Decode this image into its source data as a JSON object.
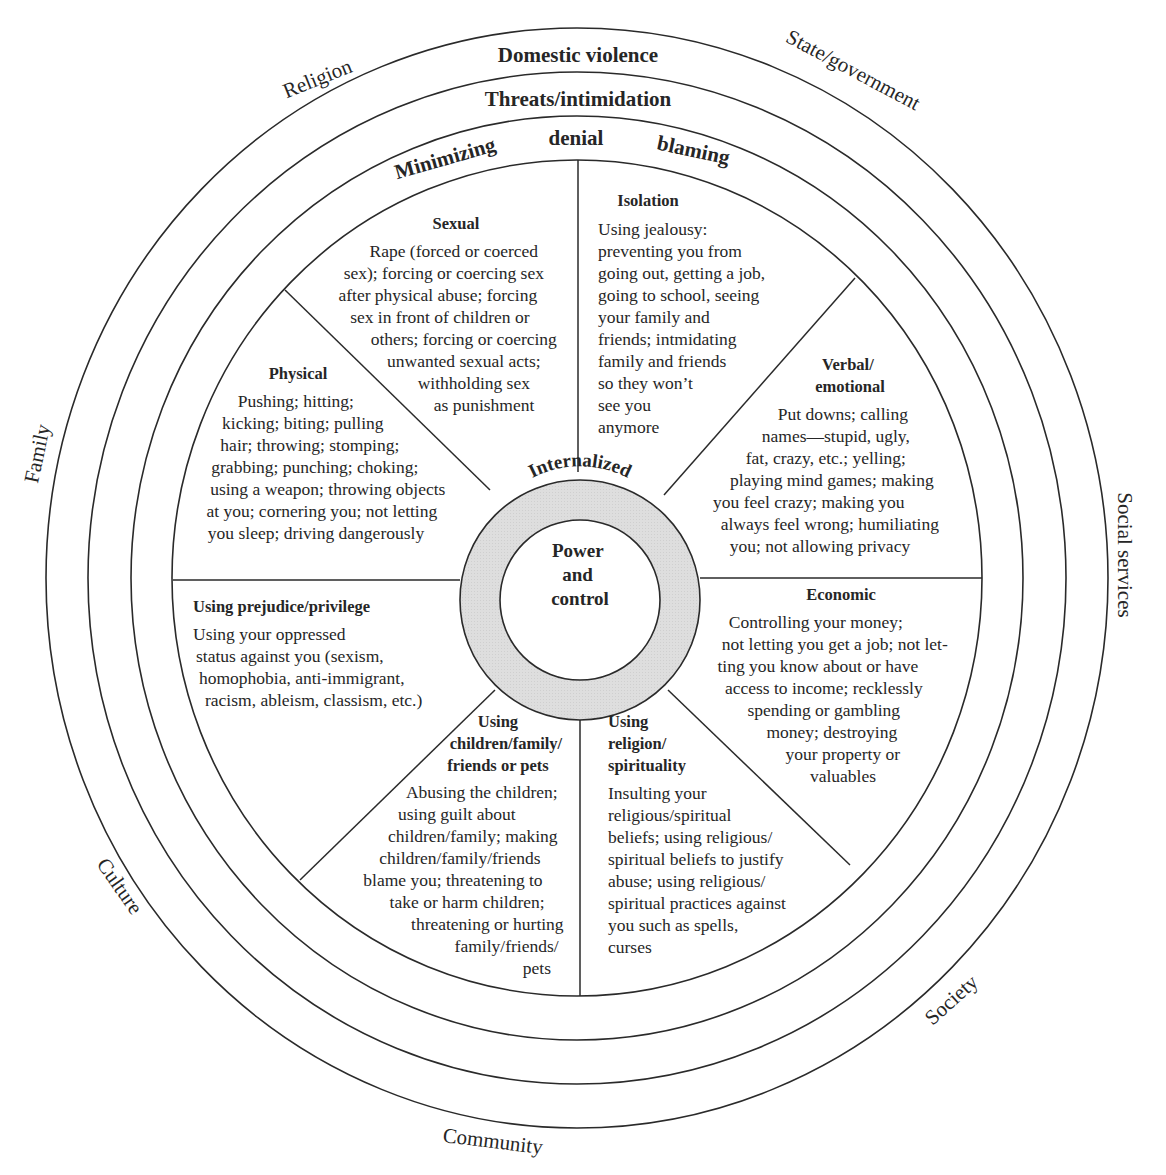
{
  "diagram": {
    "type": "concentric wheel",
    "center": {
      "title_lines": [
        "Power",
        "and",
        "control"
      ],
      "ring_label": "Internalized"
    },
    "outer_context_labels": {
      "religion": "Religion",
      "state_government": "State/government",
      "family": "Family",
      "social_services": "Social services",
      "culture": "Culture",
      "society": "Society",
      "community": "Community"
    },
    "rings": {
      "domestic_violence": "Domestic violence",
      "threats": "Threats/intimidation",
      "minimizing": "Minimizing",
      "denial": "denial",
      "blaming": "blaming"
    },
    "segments": {
      "sexual": {
        "title": "Sexual",
        "lines": [
          "Rape (forced or coerced",
          "sex); forcing or coercing sex",
          "after physical abuse; forcing",
          "sex in front of children or",
          "others; forcing or coercing",
          "unwanted sexual acts;",
          "withholding sex",
          "as punishment"
        ]
      },
      "isolation": {
        "title": "Isolation",
        "lines": [
          "Using jealousy:",
          "preventing you from",
          "going out, getting a job,",
          "going to school, seeing",
          "your family and",
          "friends; intmidating",
          "family and friends",
          "so they won’t",
          "see you",
          "anymore"
        ]
      },
      "verbal": {
        "title_lines": [
          "Verbal/",
          "emotional"
        ],
        "lines": [
          "Put downs; calling",
          "names—stupid, ugly,",
          "fat, crazy, etc.; yelling;",
          "playing mind games; making",
          "you feel crazy; making you",
          "always feel wrong; humiliating",
          "you; not allowing privacy"
        ]
      },
      "physical": {
        "title": "Physical",
        "lines": [
          "Pushing; hitting;",
          "kicking; biting; pulling",
          "hair; throwing; stomping;",
          "grabbing; punching; choking;",
          "using a weapon; throwing objects",
          "at you; cornering you; not letting",
          "you sleep; driving dangerously"
        ]
      },
      "prejudice": {
        "title": "Using prejudice/privilege",
        "lines": [
          "Using your oppressed",
          "status  against you (sexism,",
          "homophobia, anti-immigrant,",
          "racism, ableism, classism, etc.)"
        ]
      },
      "economic": {
        "title": "Economic",
        "lines": [
          "Controlling your money;",
          "not letting you get a job; not let-",
          "ting you know about or have",
          "access to income; recklessly",
          "spending or gambling",
          "money; destroying",
          "your property or",
          "valuables"
        ]
      },
      "children": {
        "title_lines": [
          "Using",
          "children/family/",
          "friends or pets"
        ],
        "lines": [
          "Abusing the children;",
          "using guilt about",
          "children/family; making",
          "children/family/friends",
          "blame you; threatening to",
          "take or harm children;",
          "threatening or hurting",
          "family/friends/",
          "pets"
        ]
      },
      "religion": {
        "title_lines": [
          "Using",
          "religion/",
          "spirituality"
        ],
        "lines": [
          "Insulting your",
          "religious/spiritual",
          "beliefs; using religious/",
          "spiritual beliefs to justify",
          "abuse; using religious/",
          "spiritual practices against",
          "you such as spells,",
          "curses"
        ]
      }
    },
    "colors": {
      "line": "#2a2a2a",
      "text": "#262626",
      "internal_ring_fill": "#dcdcdc",
      "background": "#ffffff"
    }
  }
}
